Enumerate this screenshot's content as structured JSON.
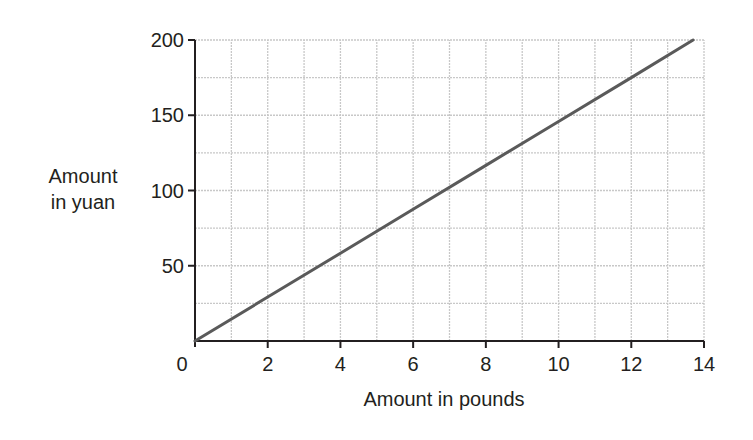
{
  "chart_data": {
    "type": "line",
    "title": "",
    "xlabel": "Amount in pounds",
    "ylabel_lines": [
      "Amount",
      "in yuan"
    ],
    "ylabel": "Amount in yuan",
    "xlim": [
      0,
      14
    ],
    "ylim": [
      0,
      200
    ],
    "x_ticks": [
      0,
      2,
      4,
      6,
      8,
      10,
      12,
      14
    ],
    "x_tick_labels": [
      "0",
      "2",
      "4",
      "6",
      "8",
      "10",
      "12",
      "14"
    ],
    "y_ticks": [
      0,
      50,
      100,
      150,
      200
    ],
    "y_tick_labels": [
      "0",
      "50",
      "100",
      "150",
      "200"
    ],
    "grid": true,
    "grid_x_step": 1,
    "grid_y_step": 25,
    "legend": null,
    "series": [
      {
        "name": "Pounds to yuan conversion",
        "x": [
          0,
          2,
          4,
          6,
          8,
          10,
          12,
          13.7
        ],
        "y": [
          0,
          29.2,
          58.3,
          87.5,
          116.7,
          145.8,
          175,
          200
        ]
      }
    ],
    "colors": {
      "line": "#5a5a5a",
      "axis": "#231f20",
      "grid": "#c8c8c8"
    }
  }
}
